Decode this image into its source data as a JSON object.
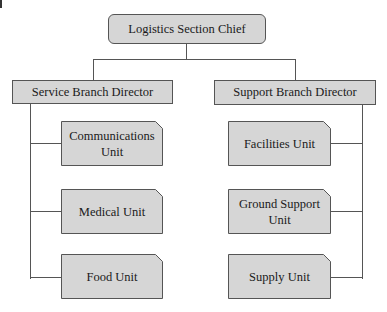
{
  "diagram": {
    "type": "org-chart",
    "root": {
      "label": "Logistics Section Chief"
    },
    "branches": [
      {
        "label": "Service Branch Director",
        "units": [
          {
            "label": "Communications Unit"
          },
          {
            "label": "Medical Unit"
          },
          {
            "label": "Food Unit"
          }
        ]
      },
      {
        "label": "Support Branch Director",
        "units": [
          {
            "label": "Facilities Unit"
          },
          {
            "label": "Ground Support Unit"
          },
          {
            "label": "Supply Unit"
          }
        ]
      }
    ],
    "colors": {
      "box_fill": "#d6d6d6",
      "line": "#555555",
      "background": "#ffffff"
    }
  }
}
